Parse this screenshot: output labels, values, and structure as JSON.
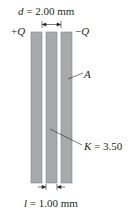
{
  "figure": {
    "separation_label": {
      "symbol": "d",
      "value": "= 2.00 mm"
    },
    "charge_left": {
      "sign": "+",
      "symbol": "Q"
    },
    "charge_right": {
      "sign": "−",
      "symbol": "Q"
    },
    "area_label": "A",
    "dielectric_label": {
      "symbol": "K",
      "value": "= 3.50"
    },
    "thickness_label": {
      "symbol": "l",
      "value": "= 1.00 mm"
    },
    "colors": {
      "plate": "#a7a9ac",
      "plate_edge": "#808285",
      "text": "#231f20"
    }
  }
}
